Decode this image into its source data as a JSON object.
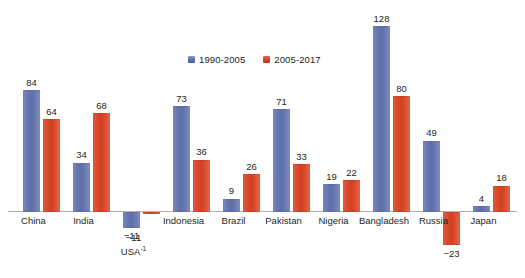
{
  "chart_data": {
    "type": "bar",
    "title": "",
    "subtitle": "",
    "xlabel": "",
    "ylabel": "",
    "grid": false,
    "legend_position": "top-center",
    "ylim": [
      -30,
      135
    ],
    "categories": [
      "China",
      "India",
      "USA",
      "Indonesia",
      "Brazil",
      "Pakistan",
      "Nigeria",
      "Bangladesh",
      "Russia",
      "Japan"
    ],
    "category_notes": {
      "USA": "-1"
    },
    "series": [
      {
        "name": "1990-2005",
        "color": "#6a7ab3",
        "values": [
          84,
          34,
          -11,
          73,
          9,
          71,
          19,
          128,
          49,
          4
        ],
        "labels": [
          "84",
          "34",
          "−11",
          "73",
          "9",
          "71",
          "19",
          "128",
          "49",
          "4"
        ]
      },
      {
        "name": "2005-2017",
        "color": "#d2401f",
        "values": [
          64,
          68,
          -1,
          36,
          26,
          33,
          22,
          80,
          -23,
          18
        ],
        "labels": [
          "64",
          "68",
          "",
          "36",
          "26",
          "33",
          "22",
          "80",
          "−23",
          "18"
        ]
      }
    ]
  },
  "legend": {
    "entries": [
      {
        "label": "1990-2005",
        "swatch": "blue-swatch-icon"
      },
      {
        "label": "2005-2017",
        "swatch": "red-swatch-icon"
      }
    ]
  },
  "axis": {
    "baseline_color": "#b3b3b3"
  },
  "labels": {
    "c0": "China",
    "c1": "India",
    "c2": "USA",
    "c2_sup": "-1",
    "c3": "Indonesia",
    "c4": "Brazil",
    "c5": "Pakistan",
    "c6": "Nigeria",
    "c7": "Bangladesh",
    "c8": "Russia",
    "c9": "Japan"
  },
  "values": {
    "china_blue": "84",
    "china_red": "64",
    "india_blue": "34",
    "india_red": "68",
    "usa_blue": "−11",
    "indonesia_blue": "73",
    "indonesia_red": "36",
    "brazil_blue": "9",
    "brazil_red": "26",
    "pakistan_blue": "71",
    "pakistan_red": "33",
    "nigeria_blue": "19",
    "nigeria_red": "22",
    "bangladesh_blue": "128",
    "bangladesh_red": "80",
    "russia_blue": "49",
    "russia_red": "−23",
    "japan_blue": "4",
    "japan_red": "18"
  }
}
